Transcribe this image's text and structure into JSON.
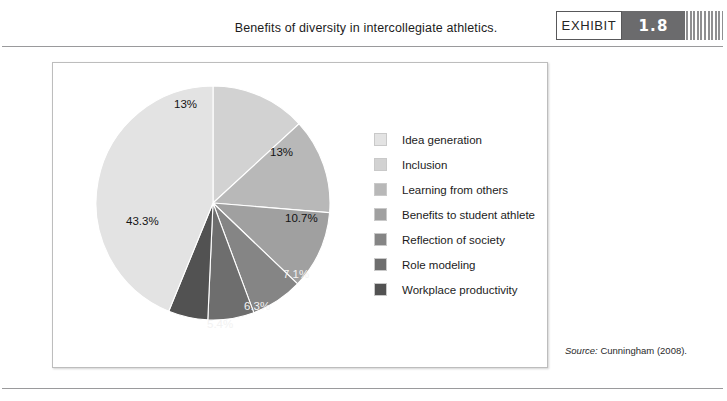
{
  "header": {
    "title": "Benefits of diversity in intercollegiate athletics.",
    "exhibit_label": "EXHIBIT",
    "exhibit_number": "1.8"
  },
  "source": {
    "prefix": "Source:",
    "text": " Cunningham (2008)."
  },
  "legend": {
    "items": [
      {
        "label": "Idea generation",
        "color": "#e3e3e3"
      },
      {
        "label": "Inclusion",
        "color": "#d2d2d2"
      },
      {
        "label": "Learning from others",
        "color": "#b8b8b8"
      },
      {
        "label": "Benefits to student athlete",
        "color": "#a0a0a0"
      },
      {
        "label": "Reflection of society",
        "color": "#858585"
      },
      {
        "label": "Role modeling",
        "color": "#6e6e6e"
      },
      {
        "label": "Workplace productivity",
        "color": "#525252"
      }
    ]
  },
  "chart_data": {
    "type": "pie",
    "title": "Benefits of diversity in intercollegiate athletics.",
    "legend_position": "right",
    "start_angle_deg": 0,
    "direction": "clockwise",
    "categories": [
      "Inclusion",
      "Learning from others",
      "Benefits to student athlete",
      "Reflection of society",
      "Role modeling",
      "Workplace productivity",
      "Idea generation"
    ],
    "values": [
      13,
      13,
      10.7,
      7.1,
      6.3,
      5.4,
      43.3
    ],
    "unit": "%",
    "data_labels": [
      "13%",
      "13%",
      "10.7%",
      "7.1%",
      "6.3%",
      "5.4%",
      "43.3%"
    ],
    "colors": [
      "#d2d2d2",
      "#b8b8b8",
      "#a0a0a0",
      "#858585",
      "#6e6e6e",
      "#525252",
      "#e3e3e3"
    ],
    "label_colors": [
      "dark",
      "dark",
      "dark",
      "light",
      "light",
      "light",
      "dark"
    ]
  }
}
